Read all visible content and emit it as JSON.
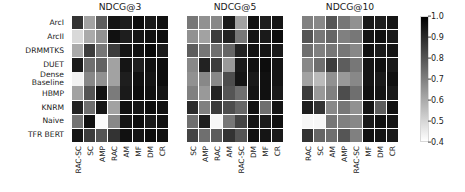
{
  "figure": {
    "rows": [
      "ArcI",
      "ArcII",
      "DRMMTKS",
      "DUET",
      "Dense\nBaseline",
      "HBMP",
      "KNRM",
      "Naive",
      "TFR BERT"
    ],
    "colorbar": {
      "ticks": [
        "1.0",
        "0.9",
        "0.8",
        "0.7",
        "0.6",
        "0.5",
        "0.4"
      ],
      "vmin": 0.4,
      "vmax": 1.0,
      "colormap": "gray_r",
      "low_color": "#ffffff",
      "high_color": "#000000"
    }
  },
  "chart_data": [
    {
      "type": "heatmap",
      "title": "NDCG@3",
      "xlabel": "",
      "ylabel": "",
      "xticklabels": [
        "RAC-SC",
        "SC",
        "AMP",
        "RAC",
        "AM",
        "MF",
        "DM",
        "CR"
      ],
      "yticklabels": [
        "ArcI",
        "ArcII",
        "DRMMTKS",
        "DUET",
        "Dense Baseline",
        "HBMP",
        "KNRM",
        "Naive",
        "TFR BERT"
      ],
      "vmin": 0.4,
      "vmax": 1.0,
      "values": [
        [
          0.88,
          0.62,
          0.78,
          0.95,
          0.93,
          0.97,
          0.94,
          0.96
        ],
        [
          0.49,
          0.6,
          0.66,
          0.96,
          0.93,
          0.95,
          0.96,
          0.97
        ],
        [
          0.6,
          0.86,
          0.72,
          0.86,
          0.95,
          0.96,
          0.98,
          0.94
        ],
        [
          0.94,
          0.74,
          0.77,
          0.62,
          0.95,
          0.93,
          0.96,
          0.97
        ],
        [
          0.43,
          0.68,
          0.66,
          0.62,
          0.93,
          0.96,
          0.95,
          0.97
        ],
        [
          0.62,
          0.8,
          0.96,
          0.71,
          0.94,
          0.97,
          0.96,
          0.95
        ],
        [
          0.92,
          0.74,
          0.95,
          0.62,
          0.96,
          0.95,
          0.97,
          0.96
        ],
        [
          0.73,
          0.96,
          0.41,
          0.68,
          0.95,
          0.97,
          0.94,
          0.96
        ],
        [
          0.95,
          0.86,
          0.8,
          0.88,
          0.96,
          0.95,
          0.97,
          0.96
        ]
      ]
    },
    {
      "type": "heatmap",
      "title": "NDCG@5",
      "xlabel": "",
      "ylabel": "",
      "xticklabels": [
        "SC",
        "AMP",
        "RAC",
        "AM",
        "RAC-SC",
        "DM",
        "MF",
        "CR"
      ],
      "yticklabels": [
        "ArcI",
        "ArcII",
        "DRMMTKS",
        "DUET",
        "Dense Baseline",
        "HBMP",
        "KNRM",
        "Naive",
        "TFR BERT"
      ],
      "vmin": 0.4,
      "vmax": 1.0,
      "values": [
        [
          0.72,
          0.66,
          0.68,
          0.94,
          0.62,
          0.96,
          0.93,
          0.95
        ],
        [
          0.66,
          0.62,
          0.86,
          0.92,
          0.72,
          0.95,
          0.94,
          0.97
        ],
        [
          0.78,
          0.72,
          0.74,
          0.76,
          0.92,
          0.96,
          0.95,
          0.94
        ],
        [
          0.68,
          0.92,
          0.86,
          0.64,
          0.94,
          0.96,
          0.97,
          0.95
        ],
        [
          0.66,
          0.68,
          0.68,
          0.82,
          0.95,
          0.94,
          0.96,
          0.95
        ],
        [
          0.7,
          0.64,
          0.92,
          0.8,
          0.74,
          0.95,
          0.96,
          0.94
        ],
        [
          0.9,
          0.7,
          0.86,
          0.82,
          0.76,
          0.96,
          0.74,
          0.95
        ],
        [
          0.74,
          0.93,
          0.42,
          0.72,
          0.84,
          0.95,
          0.94,
          0.96
        ],
        [
          0.84,
          0.74,
          0.78,
          0.88,
          0.8,
          0.96,
          0.95,
          0.94
        ]
      ]
    },
    {
      "type": "heatmap",
      "title": "NDCG@10",
      "xlabel": "",
      "ylabel": "",
      "xticklabels": [
        "RAC",
        "SC",
        "AM",
        "AMP",
        "RAC-SC",
        "MF",
        "DM",
        "CR"
      ],
      "yticklabels": [
        "ArcI",
        "ArcII",
        "DRMMTKS",
        "DUET",
        "Dense Baseline",
        "HBMP",
        "KNRM",
        "Naive",
        "TFR BERT"
      ],
      "vmin": 0.4,
      "vmax": 1.0,
      "values": [
        [
          0.7,
          0.68,
          0.8,
          0.72,
          0.66,
          0.94,
          0.93,
          0.95
        ],
        [
          0.8,
          0.72,
          0.76,
          0.7,
          0.72,
          0.95,
          0.96,
          0.94
        ],
        [
          0.74,
          0.7,
          0.72,
          0.72,
          0.68,
          0.96,
          0.94,
          0.95
        ],
        [
          0.68,
          0.74,
          0.86,
          0.78,
          0.72,
          0.95,
          0.96,
          0.94
        ],
        [
          0.62,
          0.56,
          0.66,
          0.64,
          0.68,
          0.95,
          0.94,
          0.96
        ],
        [
          0.86,
          0.64,
          0.7,
          0.82,
          0.74,
          0.96,
          0.95,
          0.94
        ],
        [
          0.93,
          0.88,
          0.68,
          0.72,
          0.66,
          0.95,
          0.78,
          0.96
        ],
        [
          0.42,
          0.42,
          0.72,
          0.7,
          0.68,
          0.94,
          0.96,
          0.95
        ],
        [
          0.88,
          0.76,
          0.74,
          0.8,
          0.7,
          0.96,
          0.95,
          0.94
        ]
      ]
    }
  ]
}
